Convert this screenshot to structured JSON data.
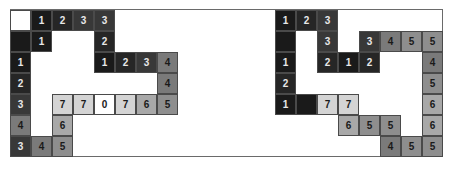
{
  "colors": {
    "c0": "#ffffff",
    "c1": "#1a1a1a",
    "c2": "#262626",
    "c3": "#383838",
    "c4": "#7a7a7a",
    "c5": "#8e8e8e",
    "c6": "#a8a8a8",
    "c7": "#d4d4d4"
  },
  "grid": {
    "cell_size": 21,
    "origin_y": 10
  },
  "left_grid": {
    "origin_x": 10,
    "cells": [
      {
        "r": 0,
        "c": 0,
        "v": "",
        "shade": "c0"
      },
      {
        "r": 0,
        "c": 1,
        "v": "1",
        "shade": "c1"
      },
      {
        "r": 0,
        "c": 2,
        "v": "2",
        "shade": "c2"
      },
      {
        "r": 0,
        "c": 3,
        "v": "3",
        "shade": "c3"
      },
      {
        "r": 0,
        "c": 4,
        "v": "3",
        "shade": "c3"
      },
      {
        "r": 1,
        "c": 0,
        "v": "",
        "shade": "c1"
      },
      {
        "r": 1,
        "c": 1,
        "v": "1",
        "shade": "c1"
      },
      {
        "r": 1,
        "c": 4,
        "v": "2",
        "shade": "c2"
      },
      {
        "r": 2,
        "c": 0,
        "v": "1",
        "shade": "c1"
      },
      {
        "r": 2,
        "c": 4,
        "v": "1",
        "shade": "c1"
      },
      {
        "r": 2,
        "c": 5,
        "v": "2",
        "shade": "c2"
      },
      {
        "r": 2,
        "c": 6,
        "v": "3",
        "shade": "c3"
      },
      {
        "r": 2,
        "c": 7,
        "v": "4",
        "shade": "c4"
      },
      {
        "r": 3,
        "c": 0,
        "v": "2",
        "shade": "c2"
      },
      {
        "r": 3,
        "c": 7,
        "v": "4",
        "shade": "c4"
      },
      {
        "r": 4,
        "c": 0,
        "v": "3",
        "shade": "c3"
      },
      {
        "r": 4,
        "c": 2,
        "v": "7",
        "shade": "c7"
      },
      {
        "r": 4,
        "c": 3,
        "v": "7",
        "shade": "c7"
      },
      {
        "r": 4,
        "c": 4,
        "v": "0",
        "shade": "c0"
      },
      {
        "r": 4,
        "c": 5,
        "v": "7",
        "shade": "c7"
      },
      {
        "r": 4,
        "c": 6,
        "v": "6",
        "shade": "c6"
      },
      {
        "r": 4,
        "c": 7,
        "v": "5",
        "shade": "c5"
      },
      {
        "r": 5,
        "c": 0,
        "v": "4",
        "shade": "c4"
      },
      {
        "r": 5,
        "c": 2,
        "v": "6",
        "shade": "c6"
      },
      {
        "r": 6,
        "c": 0,
        "v": "3",
        "shade": "c3"
      },
      {
        "r": 6,
        "c": 1,
        "v": "4",
        "shade": "c4"
      },
      {
        "r": 6,
        "c": 2,
        "v": "5",
        "shade": "c5"
      }
    ]
  },
  "right_grid": {
    "origin_x": 275,
    "cells": [
      {
        "r": 0,
        "c": 0,
        "v": "1",
        "shade": "c1"
      },
      {
        "r": 0,
        "c": 1,
        "v": "2",
        "shade": "c2"
      },
      {
        "r": 0,
        "c": 2,
        "v": "3",
        "shade": "c3"
      },
      {
        "r": 1,
        "c": 0,
        "v": "",
        "shade": "c1"
      },
      {
        "r": 1,
        "c": 2,
        "v": "3",
        "shade": "c3"
      },
      {
        "r": 1,
        "c": 4,
        "v": "3",
        "shade": "c3"
      },
      {
        "r": 1,
        "c": 5,
        "v": "4",
        "shade": "c4"
      },
      {
        "r": 1,
        "c": 6,
        "v": "5",
        "shade": "c5"
      },
      {
        "r": 1,
        "c": 7,
        "v": "5",
        "shade": "c5"
      },
      {
        "r": 2,
        "c": 0,
        "v": "1",
        "shade": "c1"
      },
      {
        "r": 2,
        "c": 2,
        "v": "2",
        "shade": "c2"
      },
      {
        "r": 2,
        "c": 3,
        "v": "1",
        "shade": "c1"
      },
      {
        "r": 2,
        "c": 4,
        "v": "2",
        "shade": "c2"
      },
      {
        "r": 2,
        "c": 7,
        "v": "4",
        "shade": "c4"
      },
      {
        "r": 3,
        "c": 0,
        "v": "2",
        "shade": "c2"
      },
      {
        "r": 3,
        "c": 7,
        "v": "5",
        "shade": "c5"
      },
      {
        "r": 4,
        "c": 0,
        "v": "1",
        "shade": "c1"
      },
      {
        "r": 4,
        "c": 1,
        "v": "",
        "shade": "c1"
      },
      {
        "r": 4,
        "c": 2,
        "v": "7",
        "shade": "c7"
      },
      {
        "r": 4,
        "c": 3,
        "v": "7",
        "shade": "c7"
      },
      {
        "r": 4,
        "c": 7,
        "v": "6",
        "shade": "c6"
      },
      {
        "r": 5,
        "c": 3,
        "v": "6",
        "shade": "c6"
      },
      {
        "r": 5,
        "c": 4,
        "v": "5",
        "shade": "c5"
      },
      {
        "r": 5,
        "c": 5,
        "v": "5",
        "shade": "c5"
      },
      {
        "r": 5,
        "c": 7,
        "v": "6",
        "shade": "c6"
      },
      {
        "r": 6,
        "c": 5,
        "v": "4",
        "shade": "c4"
      },
      {
        "r": 6,
        "c": 6,
        "v": "5",
        "shade": "c5"
      },
      {
        "r": 6,
        "c": 7,
        "v": "5",
        "shade": "c5"
      }
    ]
  }
}
